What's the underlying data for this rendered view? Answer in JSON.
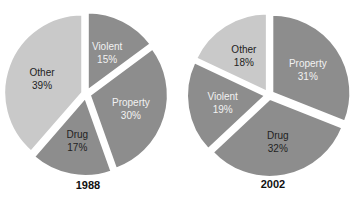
{
  "chart_data": [
    {
      "type": "pie",
      "title": "1988",
      "categories": [
        "Violent",
        "Property",
        "Drug",
        "Other"
      ],
      "values": [
        15,
        30,
        17,
        39
      ],
      "labels": [
        "15%",
        "30%",
        "17%",
        "39%"
      ],
      "colors": [
        "#8d8d8d",
        "#8d8d8d",
        "#8d8d8d",
        "#c9c9c9"
      ],
      "label_colors": [
        "#f2f2f2",
        "#f2f2f2",
        "#222222",
        "#222222"
      ],
      "start_angle_deg": 0,
      "direction": "clockwise",
      "exploded": true
    },
    {
      "type": "pie",
      "title": "2002",
      "categories": [
        "Property",
        "Drug",
        "Violent",
        "Other"
      ],
      "values": [
        31,
        32,
        19,
        18
      ],
      "labels": [
        "31%",
        "32%",
        "19%",
        "18%"
      ],
      "colors": [
        "#8d8d8d",
        "#8d8d8d",
        "#8d8d8d",
        "#c9c9c9"
      ],
      "label_colors": [
        "#f2f2f2",
        "#222222",
        "#f2f2f2",
        "#222222"
      ],
      "start_angle_deg": 0,
      "direction": "clockwise",
      "exploded": true
    }
  ],
  "charts": {
    "left": {
      "year": "1988"
    },
    "right": {
      "year": "2002"
    }
  }
}
